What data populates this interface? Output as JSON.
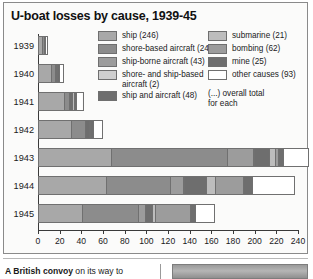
{
  "chart": {
    "title": "U-boat losses by cause, 1939-45",
    "note": "(...) overall total\nfor each"
  },
  "legend_left": [
    {
      "label": "ship (246)",
      "color": "#a8a8a8"
    },
    {
      "label": "shore-based aircraft (245)",
      "color": "#8c8c8c"
    },
    {
      "label": "ship-borne aircraft (43)",
      "color": "#9c9c9c"
    },
    {
      "label": "shore- and ship-based\naircraft (2)",
      "color": "#cfcfcf"
    },
    {
      "label": "ship and aircraft (48)",
      "color": "#6e6e6e"
    }
  ],
  "legend_right": [
    {
      "label": "submarine (21)",
      "color": "#bdbdbd"
    },
    {
      "label": "bombing (62)",
      "color": "#9c9c9c"
    },
    {
      "label": "mine (25)",
      "color": "#6e6e6e"
    },
    {
      "label": "other causes (93)",
      "color": "#ffffff"
    }
  ],
  "caption": {
    "lead": "A British convoy",
    "rest": " on its way to"
  },
  "chart_data": {
    "type": "bar",
    "orientation": "horizontal",
    "stacked": true,
    "title": "U-boat losses by cause, 1939-45",
    "xlabel": "",
    "ylabel": "",
    "xlim": [
      0,
      240
    ],
    "xticks": [
      0,
      20,
      40,
      60,
      80,
      100,
      120,
      140,
      160,
      180,
      200,
      220,
      240
    ],
    "grid": false,
    "legend_position": "top-right",
    "categories": [
      "1939",
      "1940",
      "1941",
      "1942",
      "1943",
      "1944",
      "1945"
    ],
    "series": [
      {
        "name": "ship (246)",
        "color": "#a8a8a8",
        "total": 246,
        "values": [
          5,
          13,
          25,
          31,
          68,
          63,
          41
        ]
      },
      {
        "name": "shore-based aircraft (245)",
        "color": "#8c8c8c",
        "total": 245,
        "values": [
          2,
          4,
          5,
          14,
          108,
          60,
          52
        ]
      },
      {
        "name": "ship-borne aircraft (43)",
        "color": "#9c9c9c",
        "total": 43,
        "values": [
          0,
          0,
          0,
          0,
          24,
          12,
          7
        ]
      },
      {
        "name": "shore- and ship-based aircraft (2)",
        "color": "#cfcfcf",
        "total": 2,
        "values": [
          0,
          0,
          0,
          0,
          1,
          1,
          0
        ]
      },
      {
        "name": "ship and aircraft (48)",
        "color": "#6e6e6e",
        "total": 48,
        "values": [
          0,
          1,
          3,
          4,
          14,
          20,
          6
        ]
      },
      {
        "name": "submarine (21)",
        "color": "#bdbdbd",
        "total": 21,
        "values": [
          0,
          1,
          2,
          1,
          5,
          9,
          3
        ]
      },
      {
        "name": "bombing (62)",
        "color": "#9c9c9c",
        "total": 62,
        "values": [
          0,
          0,
          0,
          0,
          3,
          26,
          33
        ]
      },
      {
        "name": "mine (25)",
        "color": "#6e6e6e",
        "total": 25,
        "values": [
          1,
          2,
          2,
          2,
          5,
          8,
          5
        ]
      },
      {
        "name": "other causes (93)",
        "color": "#ffffff",
        "total": 93,
        "values": [
          1,
          3,
          5,
          8,
          22,
          38,
          16
        ]
      }
    ],
    "row_totals": [
      9,
      24,
      42,
      60,
      250,
      237,
      163
    ]
  }
}
